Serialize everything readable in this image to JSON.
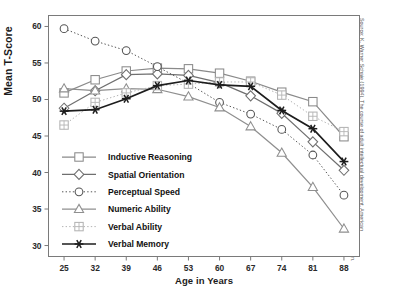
{
  "chart_data": {
    "type": "line",
    "title": "",
    "xlabel": "Age in Years",
    "ylabel": "Mean T-Score",
    "x": [
      25,
      32,
      39,
      46,
      53,
      60,
      67,
      74,
      81,
      88
    ],
    "xlim": [
      21.5,
      91.5
    ],
    "ylim": [
      28.5,
      61.5
    ],
    "yticks": [
      30,
      35,
      40,
      45,
      50,
      55,
      60
    ],
    "xticks": [
      25,
      32,
      39,
      46,
      53,
      60,
      67,
      74,
      81,
      88
    ],
    "grid": false,
    "legend_position": "center-left inside axes",
    "series": [
      {
        "name": "Inductive Reasoning",
        "marker": "square-open",
        "line": "solid",
        "color": "#8a8a8a",
        "values": [
          50.9,
          52.7,
          53.9,
          54.3,
          54.2,
          53.6,
          52.5,
          51.0,
          49.7,
          44.9
        ]
      },
      {
        "name": "Spatial Orientation",
        "marker": "diamond-open",
        "line": "solid",
        "color": "#6f6f6f",
        "values": [
          48.8,
          51.2,
          53.4,
          53.5,
          53.3,
          52.3,
          50.5,
          48.1,
          44.2,
          40.3
        ]
      },
      {
        "name": "Perceptual Speed",
        "marker": "circle-open",
        "line": "dotted",
        "color": "#555555",
        "values": [
          59.7,
          58.0,
          56.7,
          54.5,
          52.2,
          49.6,
          48.0,
          45.9,
          42.4,
          36.9
        ]
      },
      {
        "name": "Numeric Ability",
        "marker": "triangle-open",
        "line": "solid",
        "color": "#8f8f8f",
        "values": [
          51.5,
          51.2,
          51.5,
          51.4,
          50.4,
          48.9,
          46.3,
          42.7,
          38.0,
          32.3
        ]
      },
      {
        "name": "Verbal Ability",
        "marker": "square-plus",
        "line": "dotted",
        "color": "#b4b4b4",
        "values": [
          46.5,
          49.6,
          50.9,
          51.9,
          52.1,
          52.4,
          52.4,
          50.6,
          47.7,
          45.6
        ]
      },
      {
        "name": "Verbal Memory",
        "marker": "asterisk",
        "line": "solid",
        "color": "#1d1d1d",
        "values": [
          48.4,
          48.6,
          50.1,
          51.9,
          52.6,
          52.0,
          51.8,
          48.5,
          46.0,
          41.5
        ]
      }
    ]
  },
  "source": {
    "note": "Source: K. Warner Schaie (1994). The course of adult intellectual development. American Psychologist, 49, 304-313. Copyright © American Psychological Association. Reprinted by permission."
  },
  "colors": {
    "frame": "#7a7a7a",
    "background": "#ffffff",
    "text": "#1b1b1b"
  }
}
